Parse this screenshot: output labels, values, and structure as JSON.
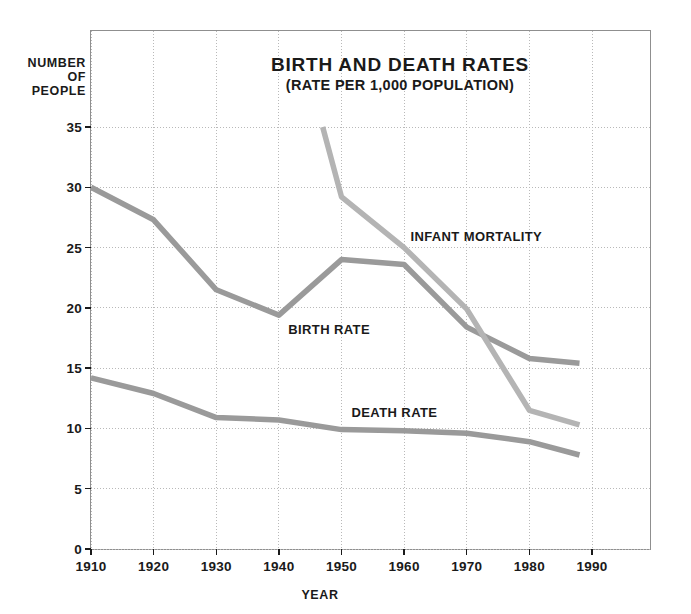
{
  "chart_data": {
    "type": "line",
    "title": "BIRTH AND DEATH RATES",
    "subtitle": "(RATE PER 1,000 POPULATION)",
    "xlabel": "YEAR",
    "ylabel": "NUMBER\nOF\nPEOPLE",
    "ylabel_lines": [
      "NUMBER",
      "OF",
      "PEOPLE"
    ],
    "xlim": [
      1910,
      1995
    ],
    "ylim": [
      0,
      35
    ],
    "grid": true,
    "legend_position": "inline-annotations",
    "xticks": [
      1910,
      1920,
      1930,
      1940,
      1950,
      1960,
      1970,
      1980,
      1990
    ],
    "xtick_labels": [
      "1910",
      "1920",
      "1930",
      "1940",
      "1950",
      "1960",
      "1970",
      "1980",
      "1990"
    ],
    "yticks": [
      0,
      5,
      10,
      15,
      20,
      25,
      30,
      35
    ],
    "ytick_labels": [
      "0",
      "5",
      "10",
      "15",
      "20",
      "25",
      "30",
      "35"
    ],
    "series": [
      {
        "name": "BIRTH RATE",
        "color": "#9a9a9a",
        "x": [
          1910,
          1920,
          1930,
          1940,
          1950,
          1960,
          1970,
          1980,
          1988
        ],
        "values": [
          30.0,
          27.3,
          21.5,
          19.4,
          24.0,
          23.6,
          18.4,
          15.8,
          15.4
        ]
      },
      {
        "name": "DEATH RATE",
        "color": "#9a9a9a",
        "x": [
          1910,
          1920,
          1930,
          1940,
          1950,
          1960,
          1970,
          1980,
          1988
        ],
        "values": [
          14.2,
          12.9,
          10.9,
          10.7,
          9.9,
          9.8,
          9.6,
          8.9,
          7.8
        ]
      },
      {
        "name": "INFANT MORTALITY",
        "color": "#b4b4b4",
        "x": [
          1947,
          1950,
          1960,
          1970,
          1980,
          1988
        ],
        "values": [
          35.0,
          29.2,
          25.0,
          19.9,
          11.5,
          10.3
        ]
      }
    ],
    "annotations": [
      {
        "text": "INFANT MORTALITY",
        "x": 1961.0,
        "y": 25.9
      },
      {
        "text": "BIRTH RATE",
        "x": 1941.5,
        "y": 18.2
      },
      {
        "text": "DEATH RATE",
        "x": 1951.6,
        "y": 11.3
      }
    ]
  },
  "colors": {
    "frame": "#8f8f8f",
    "grid": "#b9b9b9",
    "axis_text": "#1a1a1a",
    "background": "#ffffff",
    "birth_rate": "#9a9a9a",
    "death_rate": "#9a9a9a",
    "infant_mortality": "#b4b4b4"
  }
}
